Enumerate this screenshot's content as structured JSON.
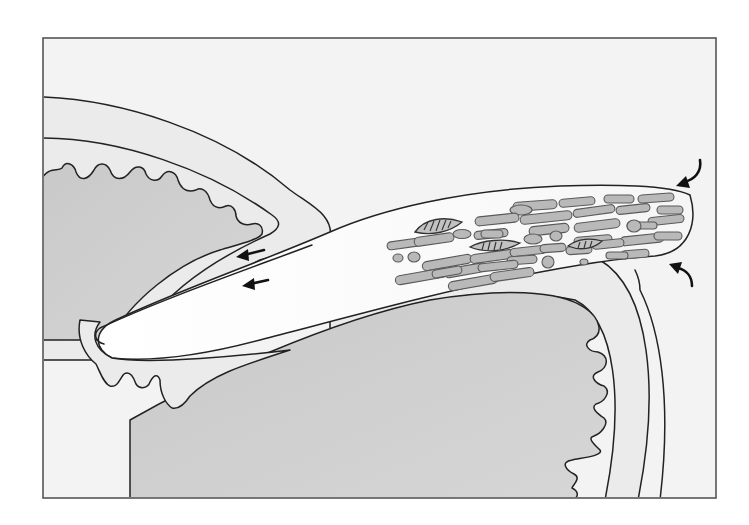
{
  "figure": {
    "type": "anatomical-diagram",
    "labels": [],
    "colors": {
      "background": "#ffffff",
      "frame_fill": "#f3f3f3",
      "frame_stroke": "#555555",
      "sac_fill": "#cfcfcf",
      "wall_fill": "#ebebeb",
      "projection_fill": "#fbfbfb",
      "cell_fill": "#b9b9b9",
      "outline": "#222222",
      "arrow": "#111111"
    },
    "frame": {
      "x": 43,
      "y": 38,
      "width": 673,
      "height": 460
    },
    "arrows": [
      {
        "name": "migration-arrow-upper",
        "direction": "left",
        "x": 250,
        "y": 250
      },
      {
        "name": "migration-arrow-lower",
        "direction": "left",
        "x": 257,
        "y": 279
      },
      {
        "name": "curved-arrow-top-right",
        "direction": "down-left",
        "x": 690,
        "y": 170
      },
      {
        "name": "curved-arrow-bottom-right",
        "direction": "up-left",
        "x": 688,
        "y": 284
      }
    ],
    "cells": {
      "elongated_count": 44,
      "round_count": 12,
      "nuclei_count": 3
    }
  }
}
